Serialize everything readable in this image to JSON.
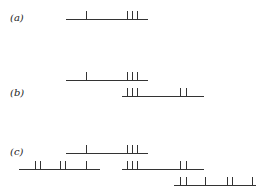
{
  "labels": {
    "a": "(a)",
    "b": "(b)",
    "c": "(c)"
  },
  "style": {
    "stroke": "#333333"
  },
  "rows": {
    "a": [
      {
        "y": 19,
        "x1": 66,
        "x2": 148,
        "ticks": [
          86,
          127,
          132,
          137
        ]
      }
    ],
    "b": [
      {
        "y": 80,
        "x1": 66,
        "x2": 148,
        "ticks": [
          86,
          127,
          132,
          137
        ]
      },
      {
        "y": 96,
        "x1": 122,
        "x2": 204,
        "ticks": [
          127,
          132,
          137,
          180,
          186
        ]
      }
    ],
    "c": [
      {
        "y": 153,
        "x1": 66,
        "x2": 148,
        "ticks": [
          86,
          127,
          132,
          137
        ]
      },
      {
        "y": 169,
        "x1": 19,
        "x2": 100,
        "ticks": [
          35,
          40,
          60,
          65,
          86
        ]
      },
      {
        "y": 169,
        "x1": 122,
        "x2": 204,
        "ticks": [
          127,
          132,
          137,
          180,
          186
        ]
      },
      {
        "y": 185,
        "x1": 174,
        "x2": 256,
        "ticks": [
          180,
          186,
          205,
          227,
          232,
          252
        ]
      }
    ]
  }
}
